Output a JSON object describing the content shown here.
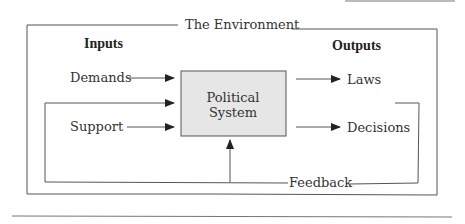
{
  "diagram": {
    "frame_title": "The Environment",
    "inputs_heading": "Inputs",
    "outputs_heading": "Outputs",
    "inputs": [
      "Demands",
      "Support"
    ],
    "outputs": [
      "Laws",
      "Decisions"
    ],
    "system": {
      "line1": "Political",
      "line2": "System"
    },
    "feedback_label": "Feedback",
    "colors": {
      "system_fill": "#e6e6e6",
      "line": "#555555"
    }
  }
}
